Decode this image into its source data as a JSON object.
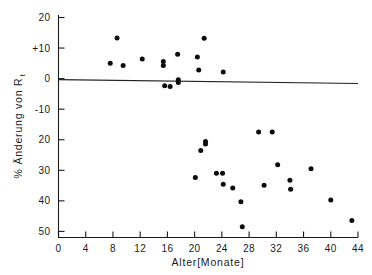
{
  "chart_data": {
    "type": "scatter",
    "title": "",
    "xlabel": "Alter[Monate]",
    "ylabel_main": "% Änderung von R",
    "ylabel_sub": "t",
    "xlim": [
      0,
      44
    ],
    "ylim": [
      -52,
      20
    ],
    "y_axis_inverted": true,
    "grid": false,
    "legend": null,
    "xticks": [
      0,
      4,
      8,
      12,
      16,
      20,
      24,
      28,
      32,
      36,
      40,
      44
    ],
    "xtick_labels": [
      "0",
      "4",
      "8",
      "12",
      "16",
      "20",
      "24",
      "28",
      "32",
      "36",
      "40",
      "44"
    ],
    "yticks": [
      20,
      10,
      0,
      -10,
      -20,
      -30,
      -40,
      -50
    ],
    "ytick_labels": [
      "20",
      "+10",
      "0",
      "-10",
      "20",
      "30",
      "40",
      "50"
    ],
    "series": [
      {
        "name": "Messpunkte",
        "marker": "filled-circle",
        "color": "#0d0d0d",
        "points": [
          {
            "x": 7.6,
            "y": 5.0
          },
          {
            "x": 8.6,
            "y": 13.3
          },
          {
            "x": 9.5,
            "y": 4.3
          },
          {
            "x": 12.3,
            "y": 6.4
          },
          {
            "x": 15.4,
            "y": 5.6
          },
          {
            "x": 15.4,
            "y": 4.3
          },
          {
            "x": 15.6,
            "y": -2.3
          },
          {
            "x": 16.4,
            "y": -2.6
          },
          {
            "x": 17.5,
            "y": 8.0
          },
          {
            "x": 17.6,
            "y": -0.4
          },
          {
            "x": 17.6,
            "y": -1.3
          },
          {
            "x": 20.4,
            "y": 7.1
          },
          {
            "x": 20.6,
            "y": 2.8
          },
          {
            "x": 21.4,
            "y": 13.2
          },
          {
            "x": 24.2,
            "y": 2.2
          },
          {
            "x": 20.1,
            "y": -32.4
          },
          {
            "x": 20.9,
            "y": -23.5
          },
          {
            "x": 21.6,
            "y": -21.4
          },
          {
            "x": 21.6,
            "y": -20.6
          },
          {
            "x": 23.2,
            "y": -31.0
          },
          {
            "x": 24.1,
            "y": -31.0
          },
          {
            "x": 24.2,
            "y": -34.6
          },
          {
            "x": 25.6,
            "y": -35.8
          },
          {
            "x": 26.8,
            "y": -40.3
          },
          {
            "x": 27.0,
            "y": -48.5
          },
          {
            "x": 29.4,
            "y": -17.5
          },
          {
            "x": 30.2,
            "y": -34.9
          },
          {
            "x": 31.4,
            "y": -17.5
          },
          {
            "x": 32.2,
            "y": -28.2
          },
          {
            "x": 34.0,
            "y": -33.3
          },
          {
            "x": 34.1,
            "y": -36.2
          },
          {
            "x": 37.1,
            "y": -29.5
          },
          {
            "x": 40.0,
            "y": -39.7
          },
          {
            "x": 43.1,
            "y": -46.4
          }
        ]
      }
    ],
    "trendline": {
      "name": "Regressionsgerade",
      "x_start": 0,
      "y_start": -0.3,
      "x_end": 44,
      "y_end": -1.6
    }
  }
}
